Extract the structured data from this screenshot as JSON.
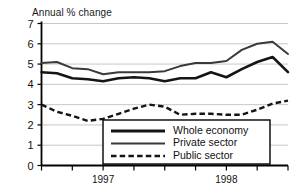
{
  "chart_data": {
    "type": "line",
    "title": "Annual % change",
    "xlabel": "",
    "ylabel": "",
    "ylim": [
      0,
      7
    ],
    "yticks": [
      0,
      1,
      2,
      3,
      4,
      5,
      6,
      7
    ],
    "ytick_labels": [
      "0",
      "1",
      "2",
      "3",
      "4",
      "5",
      "6",
      "7"
    ],
    "xtick_labels": [
      "1997",
      "1998"
    ],
    "xtick_positions": [
      4,
      12
    ],
    "x": [
      0,
      1,
      2,
      3,
      4,
      5,
      6,
      7,
      8,
      9,
      10,
      11,
      12,
      13,
      14,
      15,
      16
    ],
    "grid": true,
    "legend_position": "bottom-center",
    "series": [
      {
        "name": "Whole economy",
        "style": "solid-thick",
        "values": [
          4.6,
          4.55,
          4.3,
          4.25,
          4.15,
          4.3,
          4.35,
          4.3,
          4.15,
          4.3,
          4.3,
          4.6,
          4.35,
          4.75,
          5.1,
          5.35,
          4.6
        ]
      },
      {
        "name": "Private sector",
        "style": "solid-thin",
        "values": [
          5.05,
          5.1,
          4.8,
          4.75,
          4.5,
          4.6,
          4.6,
          4.6,
          4.65,
          4.9,
          5.05,
          5.05,
          5.15,
          5.7,
          6.0,
          6.1,
          5.5
        ]
      },
      {
        "name": "Public sector",
        "style": "dashed",
        "values": [
          3.0,
          2.65,
          2.45,
          2.2,
          2.3,
          2.55,
          2.8,
          3.0,
          2.9,
          2.5,
          2.55,
          2.55,
          2.5,
          2.5,
          2.75,
          3.05,
          3.2
        ]
      }
    ]
  },
  "legend": {
    "items": [
      {
        "label": "Whole economy",
        "style": "solid-thick"
      },
      {
        "label": "Private sector",
        "style": "solid-thin"
      },
      {
        "label": "Public sector",
        "style": "dashed"
      }
    ]
  },
  "colors": {
    "whole_economy": "#151515",
    "private_sector": "#3a3a3a",
    "public_sector": "#151515",
    "gridline": "#b9b9b9",
    "axis": "#000000",
    "background": "#ffffff"
  }
}
